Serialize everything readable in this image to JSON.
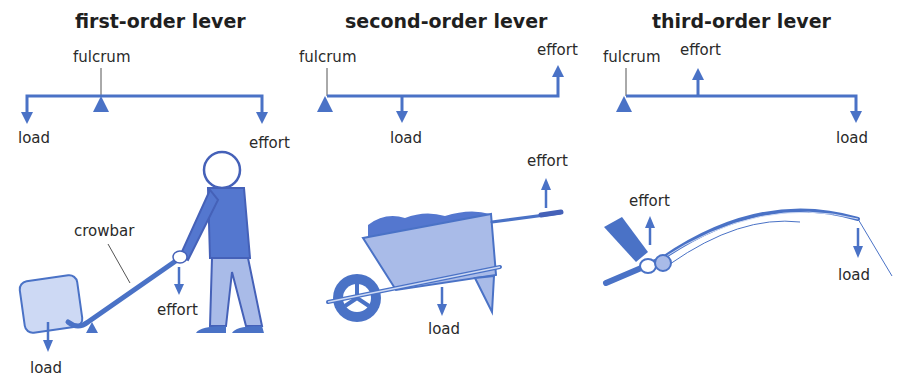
{
  "colors": {
    "primary_blue": "#4a72c6",
    "dark_blue": "#4561b8",
    "light_blue": "#a9bbe8",
    "pale_blue": "#cdd9f4",
    "text": "#2a2a2a"
  },
  "levers": [
    {
      "title": "first-order lever",
      "diagram": {
        "fulcrum_label": "fulcrum",
        "load_label": "load",
        "effort_label": "effort",
        "arrangement": "load – fulcrum – effort"
      },
      "illustration": {
        "object": "crowbar",
        "object_label": "crowbar",
        "effort_label": "effort",
        "load_label": "load"
      }
    },
    {
      "title": "second-order lever",
      "diagram": {
        "fulcrum_label": "fulcrum",
        "load_label": "load",
        "effort_label": "effort",
        "arrangement": "fulcrum – load – effort"
      },
      "illustration": {
        "object": "wheelbarrow",
        "effort_label": "effort",
        "load_label": "load"
      }
    },
    {
      "title": "third-order lever",
      "diagram": {
        "fulcrum_label": "fulcrum",
        "load_label": "load",
        "effort_label": "effort",
        "arrangement": "fulcrum – effort – load"
      },
      "illustration": {
        "object": "fishing rod",
        "effort_label": "effort",
        "load_label": "load"
      }
    }
  ]
}
